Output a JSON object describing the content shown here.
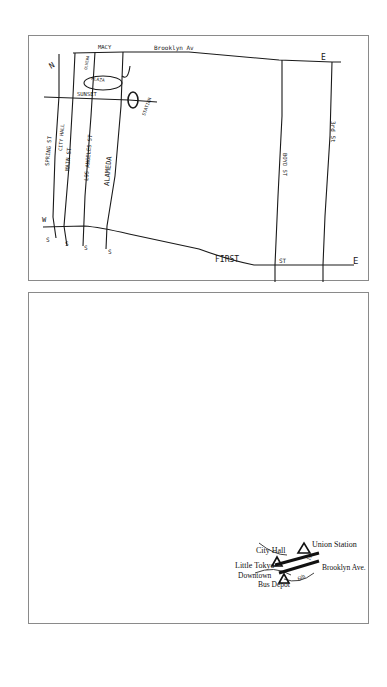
{
  "sketch_map": {
    "street_labels": {
      "macy": "MACY",
      "brooklyn_av": "Brooklyn Av",
      "sunset": "SUNSET",
      "spring_st": "SPRING ST",
      "city_hall": "CITY HALL",
      "main_st": "MAIN ST",
      "los_angeles_st": "LOS ANGELES ST",
      "alameda": "ALAMEDA",
      "first_st": "FIRST",
      "first_st_suffix": "ST",
      "third_st": "3rd St",
      "other_st": "BOYD ST",
      "olvera": "OLVERA",
      "plaza": "PLAZA",
      "station": "STATION"
    },
    "direction_marks": {
      "north_left": "N",
      "west": "W",
      "east_top": "E",
      "east_bottom": "E",
      "south_marks": [
        "S",
        "S",
        "S",
        "S"
      ],
      "n_mark": "N"
    }
  },
  "landmark_map": {
    "labels": {
      "union_station": "Union Station",
      "city_hall": "City Hall",
      "little_tokyo": "Little Tokyo",
      "downtown": "Downtown",
      "bus_depot": "Bus Depot",
      "brooklyn_ave": "Brooklyn Ave.",
      "first": "1st",
      "sixth": "6th"
    }
  },
  "colors": {
    "ink": "#1a1a1a",
    "frame": "#8a8a8a",
    "paper": "#ffffff"
  }
}
